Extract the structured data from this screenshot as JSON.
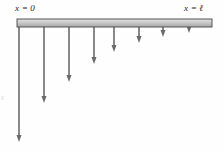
{
  "figure": {
    "background_color": "#fefefe",
    "labels": {
      "left": "x = 0",
      "right": "x = ℓ"
    },
    "beam": {
      "name": "beam",
      "x_start": 17,
      "x_end": 212,
      "y_top": 19,
      "height": 8,
      "fill_top": "#d9d9d9",
      "fill_bottom": "#a8a8a8",
      "stroke": "#545454",
      "stroke_width": 1
    },
    "arrow_color": "#6b6b6b",
    "arrow_stroke_width": 1.6,
    "arrow_head_width": 5,
    "arrow_head_length": 7
  },
  "chart_data": {
    "type": "diagram",
    "xlabel": "x",
    "ylabel": "load intensity",
    "axis_labels": [
      "x = 0",
      "x = ℓ"
    ],
    "grid": false,
    "legend": null,
    "arrows": [
      {
        "index": 1,
        "x": 19,
        "y_top": 27,
        "y_tip": 142,
        "length": 115
      },
      {
        "index": 2,
        "x": 44,
        "y_top": 27,
        "y_tip": 103,
        "length": 76
      },
      {
        "index": 3,
        "x": 69,
        "y_top": 27,
        "y_tip": 82,
        "length": 55
      },
      {
        "index": 4,
        "x": 94,
        "y_top": 27,
        "y_tip": 64,
        "length": 37
      },
      {
        "index": 5,
        "x": 114,
        "y_top": 27,
        "y_tip": 52,
        "length": 25
      },
      {
        "index": 6,
        "x": 139,
        "y_top": 27,
        "y_tip": 43,
        "length": 16
      },
      {
        "index": 7,
        "x": 163,
        "y_top": 27,
        "y_tip": 37,
        "length": 10
      },
      {
        "index": 8,
        "x": 189,
        "y_top": 27,
        "y_tip": 33,
        "length": 6
      }
    ]
  }
}
